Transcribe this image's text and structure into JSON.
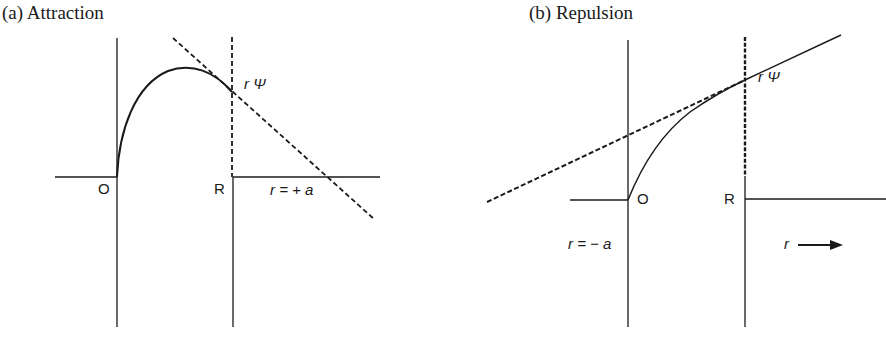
{
  "panels": [
    {
      "id": "a",
      "title": "(a) Attraction",
      "labels": {
        "origin": "O",
        "boundary": "R",
        "wavefunction": "r Ψ",
        "intercept": "r = + a"
      }
    },
    {
      "id": "b",
      "title": "(b) Repulsion",
      "labels": {
        "origin": "O",
        "boundary": "R",
        "wavefunction": "r Ψ",
        "intercept": "r = − a",
        "axis_arrow": "r"
      }
    }
  ],
  "colors": {
    "ink": "#1a1a1a",
    "background": "#ffffff"
  }
}
